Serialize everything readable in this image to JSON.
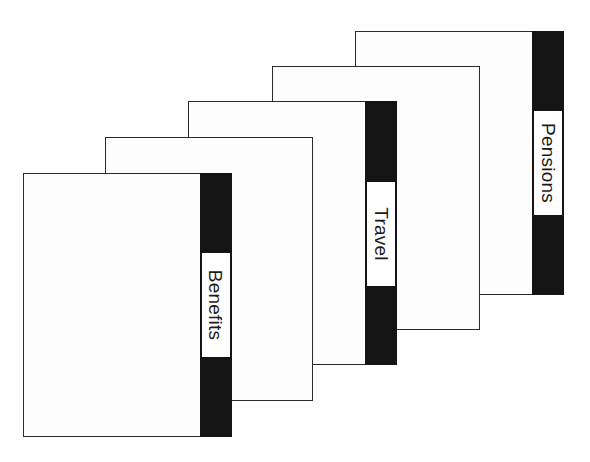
{
  "diagram": {
    "colors": {
      "tab": "#141414",
      "card_border": "#2a2a2a",
      "card_fill": "#fdfdfd"
    },
    "cards": [
      {
        "position": 5,
        "label": "Pensions",
        "has_tab": true
      },
      {
        "position": 4,
        "label": "",
        "has_tab": false
      },
      {
        "position": 3,
        "label": "Travel",
        "has_tab": true
      },
      {
        "position": 2,
        "label": "",
        "has_tab": false
      },
      {
        "position": 1,
        "label": "Benefits",
        "has_tab": true
      }
    ]
  }
}
